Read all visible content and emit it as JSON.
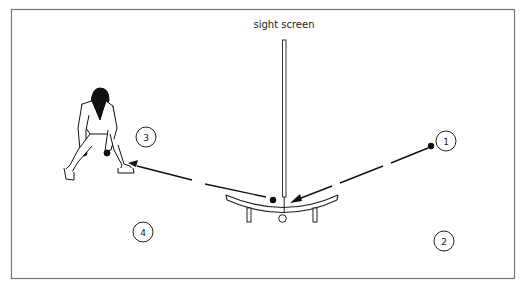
{
  "diagram": {
    "title_label": "sight screen",
    "border_color": "#777777",
    "ink_color": "#1a1a1a",
    "markers": [
      {
        "id": "1",
        "label": "1"
      },
      {
        "id": "2",
        "label": "2"
      },
      {
        "id": "3",
        "label": "3"
      },
      {
        "id": "4",
        "label": "4"
      }
    ],
    "figure": "cricket fielder crouching",
    "objects": [
      "sight-screen-pole",
      "bench",
      "ball-start",
      "ball-rebound",
      "ground-marker"
    ]
  }
}
